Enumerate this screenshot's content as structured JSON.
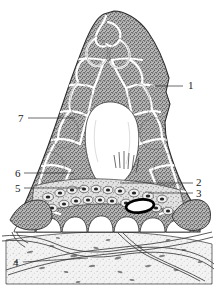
{
  "figure": {
    "background_color": "#ffffff",
    "ink_color": "#2b2b2b",
    "tissue_fill_color": "#8d8d8d",
    "cavity_color": "#ffffff",
    "base_tissue_color": "#d9d9d9",
    "accent_marked_cell_color": "#000000"
  },
  "labels": [
    {
      "id": "label-1",
      "text": "1",
      "x": 188,
      "y": 89,
      "leader_from_x": 183,
      "leader_from_y": 86,
      "leader_to_x": 150,
      "leader_to_y": 86
    },
    {
      "id": "label-2",
      "text": "2",
      "x": 196,
      "y": 186,
      "leader_from_x": 193,
      "leader_from_y": 183,
      "leader_to_x": 120,
      "leader_to_y": 183
    },
    {
      "id": "label-3",
      "text": "3",
      "x": 196,
      "y": 197,
      "leader_from_x": 193,
      "leader_from_y": 193,
      "leader_to_x": 148,
      "leader_to_y": 193
    },
    {
      "id": "label-4",
      "text": "4",
      "x": 14,
      "y": 265,
      "leader_from_x": 23,
      "leader_from_y": 262,
      "leader_to_x": 88,
      "leader_to_y": 258
    },
    {
      "id": "label-5",
      "text": "5",
      "x": 16,
      "y": 192,
      "leader_from_x": 24,
      "leader_from_y": 188,
      "leader_to_x": 84,
      "leader_to_y": 188
    },
    {
      "id": "label-6",
      "text": "6",
      "x": 16,
      "y": 177,
      "leader_from_x": 24,
      "leader_from_y": 173,
      "leader_to_x": 74,
      "leader_to_y": 173
    },
    {
      "id": "label-7",
      "text": "7",
      "x": 19,
      "y": 122,
      "leader_from_x": 28,
      "leader_from_y": 118,
      "leader_to_x": 75,
      "leader_to_y": 118
    }
  ],
  "regions": {
    "papilla": "conical stippled epithelial body",
    "cavity": "central white cavity",
    "basal_cells": "row of rounded basal cells with dark nuclei",
    "marked_cell": "bold black ellipse highlighted cell",
    "connective_tissue": "lightly stippled basal connective tissue layer",
    "vessels": "wavy paired lines representing vessels or fibre bundles"
  }
}
